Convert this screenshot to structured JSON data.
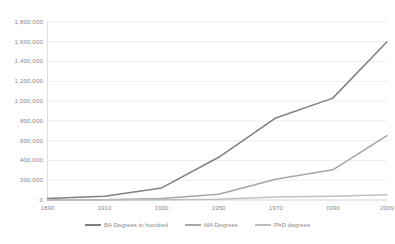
{
  "chart_data": {
    "type": "line",
    "title": "",
    "subtitle": "",
    "xlabel": "",
    "ylabel": "",
    "x": [
      1890,
      1910,
      1930,
      1950,
      1970,
      1990,
      2009
    ],
    "xtick_labels": [
      "1890",
      "1910",
      "1930",
      "1950",
      "1970",
      "1990",
      "2009"
    ],
    "ytick_labels": [
      "1,800,000",
      "1,600,000",
      "1,400,000",
      "1,200,000",
      "1,000,000",
      "800,000",
      "600,000",
      "400,000",
      "200,000",
      "0"
    ],
    "ytick_values": [
      1800000,
      1600000,
      1400000,
      1200000,
      1000000,
      800000,
      600000,
      400000,
      200000,
      0
    ],
    "ylim": [
      0,
      1800000
    ],
    "xlim": [
      1890,
      2009
    ],
    "grid": true,
    "grid_axis": "y",
    "legend_position": "bottom",
    "series": [
      {
        "name": "BA Degrees in hundred",
        "color": "#808080",
        "values": [
          15000,
          37000,
          122000,
          432000,
          830000,
          1030000,
          1600000
        ]
      },
      {
        "name": "MA Degrees",
        "color": "#a6a6a6",
        "values": [
          1000,
          2000,
          15000,
          58000,
          209000,
          305000,
          650000
        ]
      },
      {
        "name": "PhD degrees",
        "color": "#bfbfbf",
        "values": [
          150,
          400,
          2300,
          6400,
          29900,
          38400,
          52000
        ]
      }
    ]
  },
  "colors": {
    "grid": "#e8e8e8",
    "axis": "#d9d9d9",
    "tick_text": "#8a8a8a",
    "background": "#ffffff"
  }
}
